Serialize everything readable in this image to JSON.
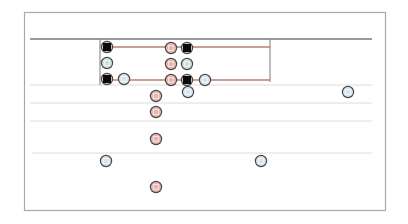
{
  "diagram": {
    "type": "node-track-diagram",
    "frame": {
      "x": 24,
      "y": 12,
      "w": 361,
      "h": 198,
      "stroke": "#a8a8a8"
    },
    "colors": {
      "heavy_line": "#7a7a7a",
      "light_line": "#dcdcdc",
      "link_line": "#b9806e",
      "box_line": "#8f8f8f",
      "node_stroke": "#4a4a4a",
      "fill_black": "#0a0a0a",
      "fill_red": "#e8b7b2",
      "fill_green": "#cfe3d6",
      "fill_blue": "#d7e4ec"
    },
    "lines": [
      {
        "id": "top-rail",
        "x1": 30,
        "y1": 39,
        "x2": 372,
        "y2": 39,
        "kind": "heavy"
      },
      {
        "id": "rail-1",
        "x1": 30,
        "y1": 85,
        "x2": 372,
        "y2": 85,
        "kind": "light"
      },
      {
        "id": "rail-2",
        "x1": 30,
        "y1": 103,
        "x2": 372,
        "y2": 103,
        "kind": "light"
      },
      {
        "id": "rail-3",
        "x1": 30,
        "y1": 121,
        "x2": 372,
        "y2": 121,
        "kind": "light"
      },
      {
        "id": "rail-4",
        "x1": 32,
        "y1": 153,
        "x2": 372,
        "y2": 153,
        "kind": "light"
      },
      {
        "id": "box-left",
        "x1": 100,
        "y1": 39,
        "x2": 100,
        "y2": 85,
        "kind": "box"
      },
      {
        "id": "box-right",
        "x1": 270,
        "y1": 39,
        "x2": 270,
        "y2": 82,
        "kind": "box"
      },
      {
        "id": "link-top",
        "x1": 108,
        "y1": 47,
        "x2": 270,
        "y2": 47,
        "kind": "link"
      },
      {
        "id": "link-bottom",
        "x1": 108,
        "y1": 80,
        "x2": 270,
        "y2": 80,
        "kind": "link"
      }
    ],
    "nodes": [
      {
        "id": "n1",
        "x": 107,
        "y": 47,
        "type": "black"
      },
      {
        "id": "n2",
        "x": 107,
        "y": 63,
        "type": "green"
      },
      {
        "id": "n3",
        "x": 107,
        "y": 79,
        "type": "black"
      },
      {
        "id": "n4",
        "x": 124,
        "y": 79,
        "type": "blue"
      },
      {
        "id": "n5",
        "x": 171,
        "y": 48,
        "type": "red"
      },
      {
        "id": "n6",
        "x": 187,
        "y": 48,
        "type": "black"
      },
      {
        "id": "n7",
        "x": 171,
        "y": 64,
        "type": "red"
      },
      {
        "id": "n8",
        "x": 187,
        "y": 64,
        "type": "green"
      },
      {
        "id": "n9",
        "x": 171,
        "y": 80,
        "type": "red"
      },
      {
        "id": "n10",
        "x": 187,
        "y": 80,
        "type": "black"
      },
      {
        "id": "n11",
        "x": 205,
        "y": 80,
        "type": "blue"
      },
      {
        "id": "n12",
        "x": 188,
        "y": 92,
        "type": "blue"
      },
      {
        "id": "n13",
        "x": 348,
        "y": 92,
        "type": "blue"
      },
      {
        "id": "n14",
        "x": 156,
        "y": 96,
        "type": "red"
      },
      {
        "id": "n15",
        "x": 156,
        "y": 112,
        "type": "red"
      },
      {
        "id": "n16",
        "x": 156,
        "y": 139,
        "type": "red"
      },
      {
        "id": "n17",
        "x": 106,
        "y": 161,
        "type": "blue"
      },
      {
        "id": "n18",
        "x": 261,
        "y": 161,
        "type": "blue"
      },
      {
        "id": "n19",
        "x": 156,
        "y": 187,
        "type": "red"
      }
    ]
  }
}
